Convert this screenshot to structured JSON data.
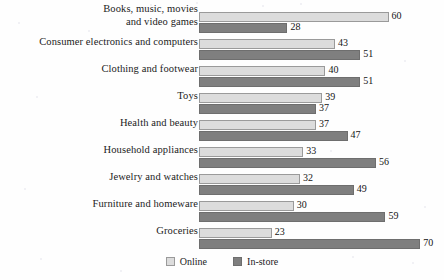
{
  "chart_data": {
    "type": "bar",
    "orientation": "horizontal",
    "title": "",
    "xlabel": "",
    "ylabel": "",
    "xlim": [
      0,
      70
    ],
    "grid": false,
    "legend_position": "bottom",
    "categories": [
      "Books, music, movies and video games",
      "Consumer electronics and computers",
      "Clothing and footwear",
      "Toys",
      "Health and beauty",
      "Household appliances",
      "Jewelry and watches",
      "Furniture and homeware",
      "Groceries"
    ],
    "category_lines": [
      [
        "Books, music, movies",
        "and video games"
      ],
      [
        "Consumer electronics and computers"
      ],
      [
        "Clothing and footwear"
      ],
      [
        "Toys"
      ],
      [
        "Health and beauty"
      ],
      [
        "Household appliances"
      ],
      [
        "Jewelry and watches"
      ],
      [
        "Furniture and homeware"
      ],
      [
        "Groceries"
      ]
    ],
    "series": [
      {
        "name": "Online",
        "color": "#dcdcdc",
        "values": [
          60,
          43,
          40,
          39,
          37,
          33,
          32,
          30,
          23
        ]
      },
      {
        "name": "In-store",
        "color": "#7f7f7f",
        "values": [
          28,
          51,
          51,
          37,
          47,
          56,
          49,
          59,
          70
        ]
      }
    ]
  },
  "legend": {
    "entries": [
      {
        "label": "Online",
        "swatch": "online-swatch"
      },
      {
        "label": "In-store",
        "swatch": "instore-swatch"
      }
    ]
  }
}
